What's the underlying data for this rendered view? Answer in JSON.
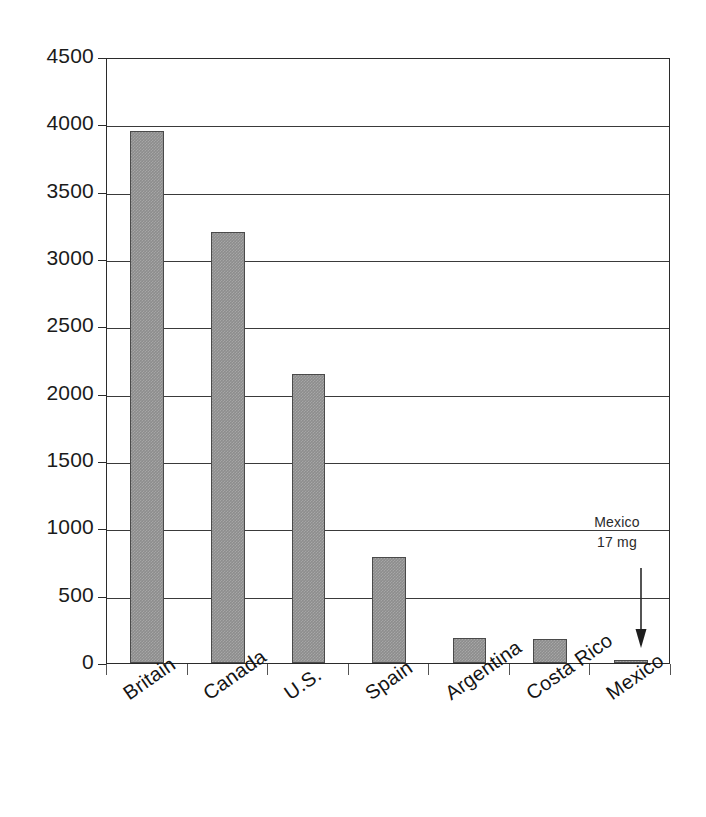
{
  "chart_data": {
    "type": "bar",
    "title": "",
    "subtitle": "",
    "xlabel": "",
    "ylabel": "",
    "categories": [
      "Britain",
      "Canada",
      "U.S.",
      "Spain",
      "Argentina",
      "Costa Rico",
      "Mexico"
    ],
    "values": [
      3950,
      3200,
      2145,
      790,
      185,
      175,
      17
    ],
    "ylim": [
      0,
      4500
    ],
    "ytick_labels": [
      "4500",
      "4000",
      "3500",
      "3000",
      "2500",
      "2000",
      "1500",
      "1000",
      "500",
      "0"
    ],
    "ytick_values": [
      4500,
      4000,
      3500,
      3000,
      2500,
      2000,
      1500,
      1000,
      500,
      0
    ],
    "grid": true,
    "legend": "none",
    "bar_color": "#8d8d8d",
    "bar_border_color": "#4a4a4a",
    "axis_color": "#2b2b2b",
    "annotations": [
      {
        "name": "mexico-callout",
        "line1": "Mexico",
        "line2": "17 mg",
        "points_to_category": "Mexico",
        "arrow": "down-arrow"
      }
    ]
  }
}
